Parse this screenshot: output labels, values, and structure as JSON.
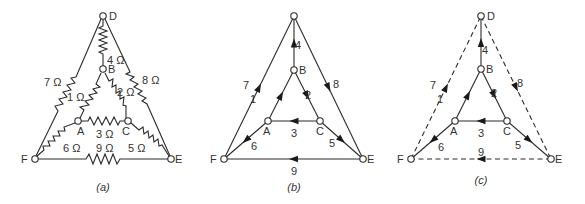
{
  "figure": {
    "panels": [
      {
        "id": "a",
        "caption": "(a)",
        "type": "circuit",
        "node_labels": {
          "D": "D",
          "B": "B",
          "A": "A",
          "C": "C",
          "F": "F",
          "E": "E"
        },
        "branches": [
          {
            "id": "1",
            "from": "A",
            "to": "B",
            "label": "1 Ω",
            "resistance_ohm": 1
          },
          {
            "id": "2",
            "from": "B",
            "to": "C",
            "label": "2 Ω",
            "resistance_ohm": 2
          },
          {
            "id": "3",
            "from": "A",
            "to": "C",
            "label": "3 Ω",
            "resistance_ohm": 3
          },
          {
            "id": "4",
            "from": "B",
            "to": "D",
            "label": "4 Ω",
            "resistance_ohm": 4
          },
          {
            "id": "5",
            "from": "C",
            "to": "E",
            "label": "5 Ω",
            "resistance_ohm": 5
          },
          {
            "id": "6",
            "from": "A",
            "to": "F",
            "label": "6 Ω",
            "resistance_ohm": 6
          },
          {
            "id": "7",
            "from": "F",
            "to": "D",
            "label": "7 Ω",
            "resistance_ohm": 7
          },
          {
            "id": "8",
            "from": "D",
            "to": "E",
            "label": "8 Ω",
            "resistance_ohm": 8
          },
          {
            "id": "9",
            "from": "E",
            "to": "F",
            "label": "9 Ω",
            "resistance_ohm": 9
          }
        ]
      },
      {
        "id": "b",
        "caption": "(b)",
        "type": "directed-graph",
        "node_labels": {
          "D": "",
          "B": "B",
          "A": "A",
          "C": "C",
          "F": "F",
          "E": "E"
        },
        "branches": [
          {
            "id": "1",
            "from": "A",
            "to": "B",
            "label": "1",
            "style": "solid"
          },
          {
            "id": "2",
            "from": "B",
            "to": "C",
            "label": "2",
            "style": "solid"
          },
          {
            "id": "3",
            "from": "C",
            "to": "A",
            "label": "3",
            "style": "solid"
          },
          {
            "id": "4",
            "from": "B",
            "to": "D",
            "label": "4",
            "style": "solid"
          },
          {
            "id": "5",
            "from": "C",
            "to": "E",
            "label": "5",
            "style": "solid"
          },
          {
            "id": "6",
            "from": "A",
            "to": "F",
            "label": "6",
            "style": "solid"
          },
          {
            "id": "7",
            "from": "F",
            "to": "D",
            "label": "7",
            "style": "solid"
          },
          {
            "id": "8",
            "from": "D",
            "to": "E",
            "label": "8",
            "style": "solid"
          },
          {
            "id": "9",
            "from": "E",
            "to": "F",
            "label": "9",
            "style": "solid"
          }
        ]
      },
      {
        "id": "c",
        "caption": "(c)",
        "type": "tree-cotree",
        "node_labels": {
          "D": "D",
          "B": "B",
          "A": "A",
          "C": "C",
          "F": "F",
          "E": "E"
        },
        "branches": [
          {
            "id": "1",
            "from": "A",
            "to": "B",
            "label": "1",
            "style": "solid"
          },
          {
            "id": "2",
            "from": "B",
            "to": "C",
            "label": "2",
            "style": "solid"
          },
          {
            "id": "3",
            "from": "C",
            "to": "A",
            "label": "3",
            "style": "solid"
          },
          {
            "id": "4",
            "from": "B",
            "to": "D",
            "label": "4",
            "style": "solid"
          },
          {
            "id": "5",
            "from": "C",
            "to": "E",
            "label": "5",
            "style": "solid"
          },
          {
            "id": "6",
            "from": "A",
            "to": "F",
            "label": "6",
            "style": "solid"
          },
          {
            "id": "7",
            "from": "F",
            "to": "D",
            "label": "7",
            "style": "dashed"
          },
          {
            "id": "8",
            "from": "D",
            "to": "E",
            "label": "8",
            "style": "dashed"
          },
          {
            "id": "9",
            "from": "E",
            "to": "F",
            "label": "9",
            "style": "dashed"
          }
        ]
      }
    ]
  }
}
